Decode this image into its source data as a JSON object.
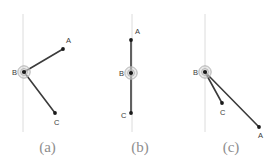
{
  "figure": {
    "width": 277,
    "height": 168,
    "background": "#ffffff"
  },
  "style": {
    "guide_line_color": "#dcdcdc",
    "segment_color": "#3b3b3b",
    "endpoint_color": "#1a1a1a",
    "vertex_ring_color": "#b4b4b4",
    "vertex_ring_fill": "#d8d8d8",
    "label_color": "#3a3a3a",
    "caption_color": "#8e8e8e"
  },
  "chart_data": {
    "type": "scatter",
    "title": "",
    "xlabel": "",
    "ylabel": "",
    "grid": false,
    "legend": null,
    "panels": [
      {
        "caption": "(a)",
        "guide_line": {
          "x": 23,
          "y1": 14,
          "y2": 132
        },
        "points": [
          {
            "name": "A",
            "x": 63,
            "y": 49,
            "marker": "dot",
            "label_dx": 3,
            "label_dy": -6
          },
          {
            "name": "B",
            "x": 24,
            "y": 72,
            "marker": "ring-dot",
            "label_dx": -12,
            "label_dy": 3
          },
          {
            "name": "C",
            "x": 55,
            "y": 113,
            "marker": "dot",
            "label_dx": -1,
            "label_dy": 12
          }
        ],
        "segments": [
          {
            "from": "B",
            "to": "A"
          },
          {
            "from": "B",
            "to": "C"
          }
        ]
      },
      {
        "caption": "(b)",
        "guide_line": {
          "x": 37,
          "y1": 14,
          "y2": 132
        },
        "points": [
          {
            "name": "A",
            "x": 36,
            "y": 40,
            "marker": "dot",
            "label_dx": 4,
            "label_dy": -6
          },
          {
            "name": "B",
            "x": 36,
            "y": 73,
            "marker": "ring-dot",
            "label_dx": -12,
            "label_dy": 3
          },
          {
            "name": "C",
            "x": 36,
            "y": 113,
            "marker": "dot",
            "label_dx": -10,
            "label_dy": 5
          }
        ],
        "segments": [
          {
            "from": "A",
            "to": "B"
          },
          {
            "from": "B",
            "to": "C"
          }
        ]
      },
      {
        "caption": "(c)",
        "guide_line": {
          "x": 20,
          "y1": 14,
          "y2": 132
        },
        "points": [
          {
            "name": "A",
            "x": 74,
            "y": 127,
            "marker": "dot",
            "label_dx": -1,
            "label_dy": 11
          },
          {
            "name": "B",
            "x": 20,
            "y": 72,
            "marker": "ring-dot",
            "label_dx": -12,
            "label_dy": 3
          },
          {
            "name": "C",
            "x": 37,
            "y": 103,
            "marker": "dot",
            "label_dx": -2,
            "label_dy": 12
          }
        ],
        "segments": [
          {
            "from": "B",
            "to": "A"
          },
          {
            "from": "B",
            "to": "C"
          }
        ]
      }
    ]
  },
  "captions": {
    "a": "(a)",
    "b": "(b)",
    "c": "(c)"
  },
  "labels": {
    "A": "A",
    "B": "B",
    "C": "C"
  }
}
